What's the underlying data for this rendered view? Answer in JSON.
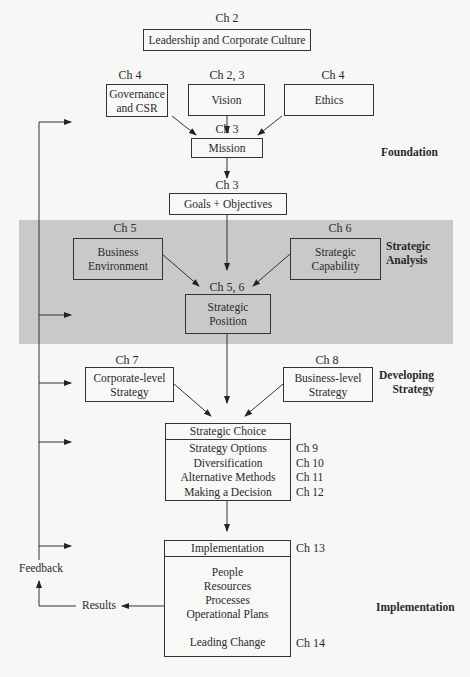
{
  "diagram": {
    "type": "strategic-management-process-flowchart",
    "nodes": {
      "leadership": {
        "chapter": "Ch 2",
        "label": "Leadership and Corporate Culture"
      },
      "governance": {
        "chapter": "Ch 4",
        "label_line1": "Governance",
        "label_line2": "and CSR"
      },
      "vision": {
        "chapter": "Ch 2, 3",
        "label": "Vision"
      },
      "ethics": {
        "chapter": "Ch 4",
        "label": "Ethics"
      },
      "mission": {
        "chapter": "Ch 3",
        "label": "Mission"
      },
      "goals": {
        "chapter": "Ch 3",
        "label": "Goals + Objectives"
      },
      "business_environment": {
        "chapter": "Ch 5",
        "label_line1": "Business",
        "label_line2": "Environment"
      },
      "strategic_capability": {
        "chapter": "Ch 6",
        "label_line1": "Strategic",
        "label_line2": "Capability"
      },
      "strategic_position": {
        "chapter": "Ch 5, 6",
        "label_line1": "Strategic",
        "label_line2": "Position"
      },
      "corporate_strategy": {
        "chapter": "Ch 7",
        "label_line1": "Corporate-level",
        "label_line2": "Strategy"
      },
      "business_strategy": {
        "chapter": "Ch 8",
        "label_line1": "Business-level",
        "label_line2": "Strategy"
      },
      "strategic_choice": {
        "header": "Strategic Choice",
        "items": [
          {
            "label": "Strategy Options",
            "chapter": "Ch 9"
          },
          {
            "label": "Diversification",
            "chapter": "Ch 10"
          },
          {
            "label": "Alternative Methods",
            "chapter": "Ch 11"
          },
          {
            "label": "Making a Decision",
            "chapter": "Ch 12"
          }
        ]
      },
      "implementation": {
        "header": "Implementation",
        "header_chapter": "Ch 13",
        "items": [
          "People",
          "Resources",
          "Processes",
          "Operational Plans"
        ],
        "leading_change": "Leading Change",
        "leading_change_chapter": "Ch 14"
      }
    },
    "stages": {
      "foundation": "Foundation",
      "strategic_analysis_line1": "Strategic",
      "strategic_analysis_line2": "Analysis",
      "developing_strategy_line1": "Developing",
      "developing_strategy_line2": "Strategy",
      "implementation": "Implementation"
    },
    "loop": {
      "feedback": "Feedback",
      "results": "Results"
    },
    "colors": {
      "background": "#f7f7f5",
      "analysis_band": "#c9c9c7",
      "line": "#222222"
    }
  }
}
